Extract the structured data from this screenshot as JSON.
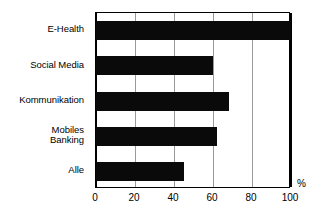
{
  "chart_data": {
    "type": "bar",
    "orientation": "horizontal",
    "title": "",
    "xlabel": "%",
    "ylabel": "",
    "categories": [
      "E-Health",
      "Social Media",
      "Kommunikation",
      "Mobiles\nBanking",
      "Alle"
    ],
    "values": [
      100,
      60,
      68,
      62,
      45
    ],
    "xlim": [
      0,
      100
    ],
    "xticks": [
      0,
      20,
      40,
      60,
      80,
      100
    ],
    "xtick_labels": [
      "0",
      "20",
      "40",
      "60",
      "80",
      "100"
    ],
    "grid": true,
    "grid_axis": "x",
    "legend": null,
    "bar_color": "#0a0a0a",
    "grid_color": "#9a9a9a",
    "axis_color": "#000000",
    "background_color": "#ffffff"
  },
  "axis": {
    "unit": "%"
  }
}
